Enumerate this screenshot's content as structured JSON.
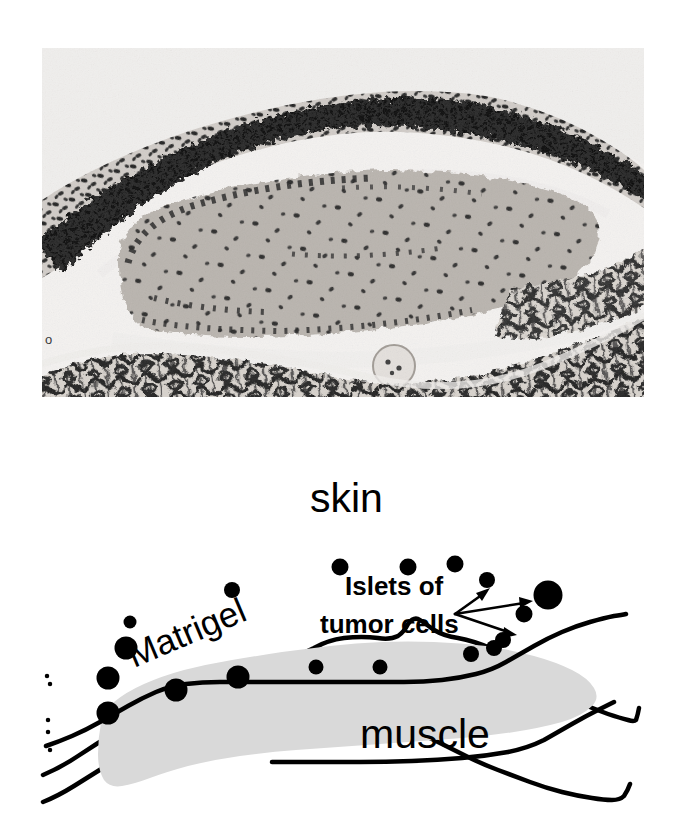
{
  "figure": {
    "panels": [
      {
        "id": "micrograph",
        "type": "photomicrograph",
        "description": "H&E stained tissue section showing skin, Matrigel plug and underlying muscle"
      },
      {
        "id": "schematic",
        "type": "line-diagram",
        "description": "Labeled schematic of the same tissue arrangement"
      }
    ]
  },
  "micrograph": {
    "scale_marker": "o",
    "background_color": "#f2f0ee",
    "plug_fill_color": "#b9b3ad",
    "tissue_stain_color": "#2b2b2b"
  },
  "schematic": {
    "labels": {
      "skin": "skin",
      "matrigel": "Matrigel",
      "muscle": "muscle",
      "islets_line1": "Islets of",
      "islets_line2": "tumor cells"
    },
    "colors": {
      "outline": "#000000",
      "matrigel_fill": "#d9d9d9",
      "tumor_cell": "#000000",
      "background": "#ffffff"
    },
    "matrigel_label_rotation_deg": -23,
    "pointer_origin": {
      "x": 455,
      "y": 184
    },
    "pointer_targets": [
      {
        "x": 489,
        "y": 161
      },
      {
        "x": 531,
        "y": 172
      },
      {
        "x": 515,
        "y": 204
      }
    ],
    "tumor_cells": [
      {
        "x": 130,
        "y": 192,
        "r": 6.5
      },
      {
        "x": 126,
        "y": 218,
        "r": 11.5
      },
      {
        "x": 108,
        "y": 248,
        "r": 11.5
      },
      {
        "x": 108,
        "y": 283,
        "r": 11.5
      },
      {
        "x": 176,
        "y": 260,
        "r": 11.5
      },
      {
        "x": 232,
        "y": 160,
        "r": 8.0
      },
      {
        "x": 238,
        "y": 247,
        "r": 11.5
      },
      {
        "x": 340,
        "y": 137,
        "r": 8.5
      },
      {
        "x": 316,
        "y": 237,
        "r": 7.5
      },
      {
        "x": 380,
        "y": 237,
        "r": 7.5
      },
      {
        "x": 408,
        "y": 137,
        "r": 8.5
      },
      {
        "x": 455,
        "y": 134,
        "r": 8.5
      },
      {
        "x": 487,
        "y": 150,
        "r": 8.0
      },
      {
        "x": 471,
        "y": 224,
        "r": 8.0
      },
      {
        "x": 503,
        "y": 210,
        "r": 8.0
      },
      {
        "x": 524,
        "y": 184,
        "r": 8.5
      },
      {
        "x": 548,
        "y": 165,
        "r": 14.5
      },
      {
        "x": 494,
        "y": 218,
        "r": 8.0
      }
    ]
  }
}
